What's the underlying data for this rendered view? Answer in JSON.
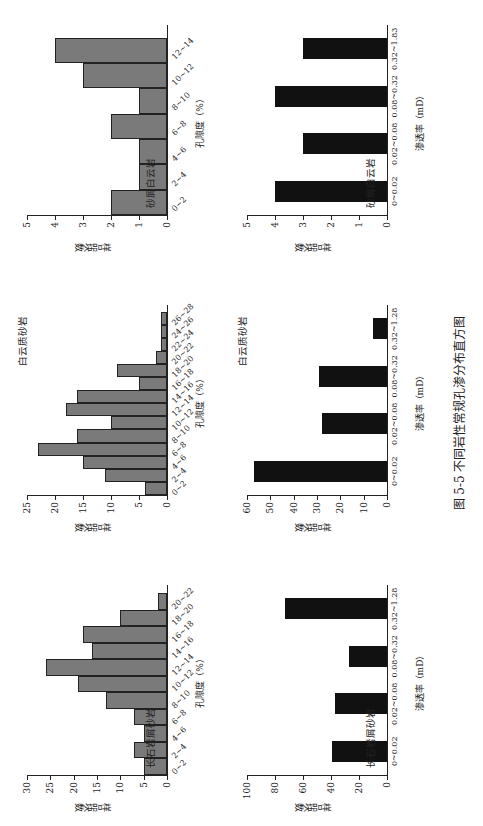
{
  "caption": "图 5-5   不同岩性常规孔渗分布直方图",
  "chart_data": [
    {
      "type": "bar",
      "position": "top-left",
      "title": "长石岩屑砂岩",
      "xlabel": "孔隙度（%）",
      "ylabel": "样品块数",
      "ylim": [
        0,
        30
      ],
      "yticks": [
        0,
        5,
        10,
        15,
        20,
        25,
        30
      ],
      "categories": [
        "0~2",
        "2~4",
        "4~6",
        "6~8",
        "8~10",
        "10~12",
        "12~14",
        "14~16",
        "16~18",
        "18~20",
        "20~22"
      ],
      "values": [
        5,
        7,
        5,
        7,
        13,
        19,
        26,
        16,
        18,
        10,
        2
      ]
    },
    {
      "type": "bar",
      "position": "top-middle",
      "title": "白云质砂岩",
      "xlabel": "孔隙度（%）",
      "ylabel": "样品块数",
      "ylim": [
        0,
        25
      ],
      "yticks": [
        0,
        5,
        10,
        15,
        20,
        25
      ],
      "categories": [
        "0~2",
        "2~4",
        "4~6",
        "6~8",
        "8~10",
        "10~12",
        "12~14",
        "14~16",
        "16~18",
        "18~20",
        "20~22",
        "22~24",
        "24~26",
        "26~28"
      ],
      "values": [
        4,
        11,
        15,
        23,
        16,
        10,
        18,
        16,
        5,
        9,
        2,
        1,
        1,
        1
      ]
    },
    {
      "type": "bar",
      "position": "top-right",
      "title": "砂屑白云岩",
      "xlabel": "孔隙度（%）",
      "ylabel": "样品块数",
      "ylim": [
        0,
        5
      ],
      "yticks": [
        0,
        1,
        2,
        3,
        4,
        5
      ],
      "categories": [
        "0~2",
        "2~4",
        "4~6",
        "6~8",
        "8~10",
        "10~12",
        "12~14"
      ],
      "values": [
        2,
        1,
        1,
        2,
        1,
        3,
        4
      ]
    },
    {
      "type": "bar",
      "position": "bottom-left",
      "title": "长石岩屑砂岩",
      "xlabel": "渗透率（mD）",
      "ylabel": "样品块数",
      "ylim": [
        0,
        100
      ],
      "yticks": [
        0,
        20,
        40,
        60,
        80,
        100
      ],
      "categories": [
        "0~0.02",
        "0.02~0.08",
        "0.08~0.32",
        "0.32~1.28"
      ],
      "values": [
        39,
        37,
        27,
        73
      ]
    },
    {
      "type": "bar",
      "position": "bottom-middle",
      "title": "白云质砂岩",
      "xlabel": "渗透率（mD）",
      "ylabel": "样品块数",
      "ylim": [
        0,
        60
      ],
      "yticks": [
        0,
        10,
        20,
        30,
        40,
        50,
        60
      ],
      "categories": [
        "0~0.02",
        "0.02~0.08",
        "0.08~0.32",
        "0.32~1.28"
      ],
      "values": [
        57,
        28,
        29,
        6
      ]
    },
    {
      "type": "bar",
      "position": "bottom-right",
      "title": "砂屑白云岩",
      "xlabel": "渗透率（mD）",
      "ylabel": "样品块数",
      "ylim": [
        0,
        5
      ],
      "yticks": [
        0,
        1,
        2,
        3,
        4,
        5
      ],
      "categories": [
        "0~0.02",
        "0.02~0.08",
        "0.08~0.32",
        "0.32~1.83"
      ],
      "values": [
        4,
        3,
        4,
        3
      ]
    }
  ]
}
